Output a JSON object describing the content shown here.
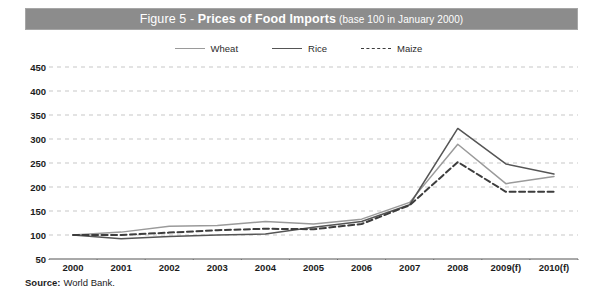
{
  "figure": {
    "title_prefix": "Figure 5 - ",
    "title_main": "Prices of Food Imports",
    "title_suffix": " (base 100 in January 2000)",
    "title_full": "Figure 5 - Prices of Food Imports (base 100 in January 2000)",
    "band_color": "#8c8c8c",
    "band_text_color": "#ffffff"
  },
  "source": {
    "label": "Source:",
    "value": "World Bank."
  },
  "legend": {
    "position": "top-center",
    "items": [
      {
        "label": "Wheat",
        "color": "#9a9a9a",
        "style": "solid"
      },
      {
        "label": "Rice",
        "color": "#555555",
        "style": "solid"
      },
      {
        "label": "Maize",
        "color": "#3d3d3d",
        "style": "dashed"
      }
    ]
  },
  "chart_data": {
    "type": "line",
    "title": "Figure 5 - Prices of Food Imports (base 100 in January 2000)",
    "subtitle": "base 100 in January 2000",
    "xlabel": "",
    "ylabel": "",
    "categories": [
      "2000",
      "2001",
      "2002",
      "2003",
      "2004",
      "2005",
      "2006",
      "2007",
      "2008",
      "2009(f)",
      "2010(f)"
    ],
    "x": [
      "2000",
      "2001",
      "2002",
      "2003",
      "2004",
      "2005",
      "2006",
      "2007",
      "2008",
      "2009(f)",
      "2010(f)"
    ],
    "xticklabels": [
      "2000",
      "2001",
      "2002",
      "2003",
      "2004",
      "2005",
      "2006",
      "2007",
      "2008",
      "2009(f)",
      "2010(f)"
    ],
    "yticks": [
      50,
      100,
      150,
      200,
      250,
      300,
      350,
      400,
      450
    ],
    "yticklabels": [
      "50",
      "100",
      "150",
      "200",
      "250",
      "300",
      "350",
      "400",
      "450"
    ],
    "ylim": [
      50,
      450
    ],
    "grid": "horizontal-dashed",
    "legend_position": "top-center",
    "series": [
      {
        "name": "Wheat",
        "color": "#9a9a9a",
        "style": "solid",
        "values": [
          100,
          106,
          118,
          120,
          128,
          123,
          133,
          168,
          289,
          207,
          222
        ]
      },
      {
        "name": "Rice",
        "color": "#555555",
        "style": "solid",
        "values": [
          100,
          92,
          97,
          100,
          102,
          116,
          128,
          163,
          322,
          248,
          227
        ]
      },
      {
        "name": "Maize",
        "color": "#3d3d3d",
        "style": "dashed",
        "values": [
          100,
          100,
          105,
          110,
          113,
          112,
          123,
          162,
          252,
          190,
          190
        ]
      }
    ]
  }
}
